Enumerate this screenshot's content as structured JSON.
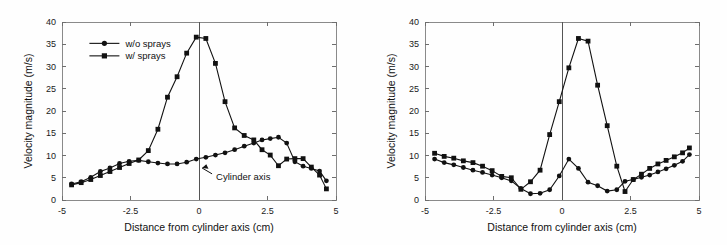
{
  "figure": {
    "background": "#fefefe",
    "ink": "#111111",
    "panel_count": 2
  },
  "chart_data": [
    {
      "id": "left-panel",
      "type": "line",
      "title": "",
      "xlabel": "Distance from cylinder axis (cm)",
      "ylabel": "Velocity magnitude (m/s)",
      "xlim": [
        -5,
        5
      ],
      "ylim": [
        0,
        40
      ],
      "xticks": [
        -5,
        -2.5,
        0,
        2.5,
        5
      ],
      "xticklabels": [
        "-5",
        "-2.5",
        "0",
        "2.5",
        "5"
      ],
      "yticks": [
        0,
        5,
        10,
        15,
        20,
        25,
        30,
        35,
        40
      ],
      "yticklabels": [
        "0",
        "5",
        "10",
        "15",
        "20",
        "25",
        "30",
        "35",
        "40"
      ],
      "grid": false,
      "legend_position": "upper-left",
      "annotations": [
        {
          "text": "Cylinder axis",
          "x": 0.55,
          "y": 5.2,
          "arrow_to_x": 0.0,
          "arrow_to_y": 8.1
        }
      ],
      "vertical_reference_line": {
        "x": 0,
        "label": "Cylinder axis"
      },
      "series": [
        {
          "name": "w/o sprays",
          "marker": "circle",
          "x": [
            -4.65,
            -4.3,
            -3.95,
            -3.6,
            -3.25,
            -2.9,
            -2.55,
            -2.2,
            -1.85,
            -1.5,
            -1.15,
            -0.8,
            -0.45,
            -0.1,
            0.25,
            0.6,
            0.95,
            1.3,
            1.65,
            2.0,
            2.3,
            2.6,
            2.9,
            3.2,
            3.5,
            3.8,
            4.1,
            4.4,
            4.65
          ],
          "y": [
            3.6,
            4.1,
            5.1,
            6.4,
            7.2,
            8.2,
            8.7,
            8.9,
            8.6,
            8.3,
            8.1,
            8.1,
            8.5,
            9.2,
            9.6,
            10.1,
            10.6,
            11.3,
            12.1,
            12.8,
            13.5,
            13.8,
            14.1,
            12.8,
            8.6,
            7.6,
            7.1,
            6.5,
            4.3
          ]
        },
        {
          "name": "w/ sprays",
          "marker": "square",
          "x": [
            -4.65,
            -4.3,
            -3.95,
            -3.6,
            -3.25,
            -2.9,
            -2.55,
            -2.2,
            -1.85,
            -1.5,
            -1.15,
            -0.8,
            -0.45,
            -0.1,
            0.25,
            0.6,
            0.95,
            1.3,
            1.65,
            2.0,
            2.3,
            2.6,
            2.9,
            3.2,
            3.5,
            3.8,
            4.1,
            4.4,
            4.65
          ],
          "y": [
            3.4,
            3.9,
            4.6,
            5.5,
            6.4,
            7.3,
            8.2,
            9.0,
            11.1,
            15.9,
            23.1,
            27.7,
            33.0,
            36.6,
            36.3,
            30.7,
            22.1,
            16.2,
            14.5,
            13.5,
            11.3,
            10.1,
            7.7,
            9.2,
            9.3,
            9.3,
            7.4,
            5.6,
            2.5
          ]
        }
      ]
    },
    {
      "id": "right-panel",
      "type": "line",
      "title": "",
      "xlabel": "Distance from cylinder axis (cm)",
      "ylabel": "Velocity magnitude (m/s)",
      "xlim": [
        -5,
        5
      ],
      "ylim": [
        0,
        40
      ],
      "xticks": [
        -5,
        -2.5,
        0,
        2.5,
        5
      ],
      "xticklabels": [
        "-5",
        "-2.5",
        "0",
        "2.5",
        "5"
      ],
      "yticks": [
        0,
        5,
        10,
        15,
        20,
        25,
        30,
        35,
        40
      ],
      "yticklabels": [
        "0",
        "5",
        "10",
        "15",
        "20",
        "25",
        "30",
        "35",
        "40"
      ],
      "grid": false,
      "legend_position": "none",
      "annotations": [],
      "vertical_reference_line": {
        "x": 0,
        "label": ""
      },
      "series": [
        {
          "name": "w/o sprays",
          "marker": "circle",
          "x": [
            -4.65,
            -4.3,
            -3.95,
            -3.6,
            -3.25,
            -2.9,
            -2.55,
            -2.2,
            -1.85,
            -1.5,
            -1.15,
            -0.8,
            -0.45,
            -0.1,
            0.25,
            0.6,
            0.95,
            1.3,
            1.65,
            2.0,
            2.3,
            2.6,
            2.9,
            3.2,
            3.5,
            3.8,
            4.1,
            4.4,
            4.65
          ],
          "y": [
            9.2,
            8.4,
            7.9,
            7.3,
            6.7,
            6.2,
            5.6,
            5.0,
            4.3,
            2.6,
            1.4,
            1.5,
            2.3,
            5.4,
            9.2,
            7.1,
            4.0,
            3.2,
            2.0,
            2.3,
            4.2,
            4.6,
            5.1,
            5.6,
            6.3,
            7.0,
            7.8,
            8.7,
            10.2
          ]
        },
        {
          "name": "w/ sprays",
          "marker": "square",
          "x": [
            -4.65,
            -4.3,
            -3.95,
            -3.6,
            -3.25,
            -2.9,
            -2.55,
            -2.2,
            -1.85,
            -1.5,
            -1.15,
            -0.8,
            -0.45,
            -0.1,
            0.25,
            0.6,
            0.95,
            1.3,
            1.65,
            2.0,
            2.3,
            2.6,
            2.9,
            3.2,
            3.5,
            3.8,
            4.1,
            4.4,
            4.65
          ],
          "y": [
            10.5,
            9.8,
            9.4,
            8.8,
            8.4,
            7.6,
            6.6,
            5.3,
            5.0,
            2.4,
            4.1,
            6.7,
            14.7,
            22.1,
            29.7,
            36.3,
            35.7,
            25.8,
            16.7,
            7.6,
            1.9,
            4.6,
            5.8,
            7.1,
            8.1,
            8.9,
            9.7,
            10.6,
            11.7
          ]
        }
      ]
    }
  ],
  "legend": {
    "items": [
      {
        "label": "w/o sprays",
        "marker": "circle"
      },
      {
        "label": "w/ sprays",
        "marker": "square"
      }
    ]
  }
}
